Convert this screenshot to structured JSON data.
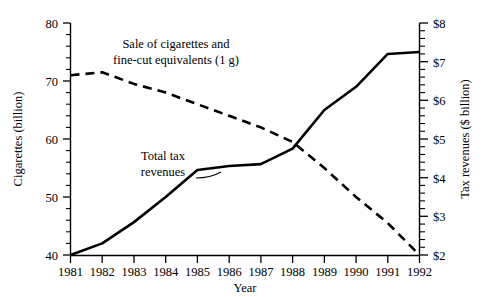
{
  "chart_data": {
    "type": "line",
    "title": "",
    "subtitle": "",
    "xlabel": "Year",
    "ylabel": "Cigarettes (billion)",
    "y2label": "Tax revenues ($ billion)",
    "x": [
      1981,
      1982,
      1983,
      1984,
      1985,
      1986,
      1987,
      1988,
      1989,
      1990,
      1991,
      1992
    ],
    "categories": [
      "1981",
      "1982",
      "1983",
      "1984",
      "1985",
      "1986",
      "1987",
      "1988",
      "1989",
      "1990",
      "1991",
      "1992"
    ],
    "xlim": [
      1981,
      1992
    ],
    "ylim": [
      40,
      80
    ],
    "y2lim": [
      2,
      8
    ],
    "y_ticks": [
      40,
      50,
      60,
      70,
      80
    ],
    "y_tick_labels": [
      "40",
      "50",
      "60",
      "70",
      "80"
    ],
    "y_minor_step": 2,
    "y2_ticks": [
      2,
      3,
      4,
      5,
      6,
      7,
      8
    ],
    "y2_tick_labels": [
      "$2",
      "$3",
      "$4",
      "$5",
      "$6",
      "$7",
      "$8"
    ],
    "y2_minor_step": 0.2,
    "grid": false,
    "legend_position": "inline-annotations",
    "series": [
      {
        "name": "Sale of cigarettes and fine-cut equivalents (1 g)",
        "axis": "left",
        "style": "dashed",
        "units": "billion cigarettes",
        "values": [
          71.0,
          71.5,
          69.5,
          68.0,
          66.0,
          64.0,
          62.0,
          59.5,
          55.0,
          50.0,
          45.5,
          40.0
        ]
      },
      {
        "name": "Total tax revenues",
        "axis": "right",
        "style": "solid",
        "units": "$ billion",
        "values": [
          2.0,
          2.3,
          2.85,
          3.5,
          4.2,
          4.3,
          4.35,
          4.75,
          5.75,
          6.35,
          7.2,
          7.25
        ]
      }
    ],
    "annotations": [
      {
        "name": "sale-of-cigarettes-label",
        "line1": "Sale of cigarettes and",
        "line2": "fine-cut equivalents (1 g)"
      },
      {
        "name": "total-tax-revenues-label",
        "line1": "Total tax",
        "line2": "revenues"
      }
    ],
    "colors": {
      "ink": "#000000",
      "background": "#ffffff"
    }
  },
  "axes": {
    "left": {
      "title": "Cigarettes (billion)",
      "labels": [
        "80",
        "70",
        "60",
        "50",
        "40"
      ]
    },
    "right": {
      "title": "Tax revenues ($ billion)",
      "labels": [
        "$8",
        "$7",
        "$6",
        "$5",
        "$4",
        "$3",
        "$2"
      ]
    },
    "bottom": {
      "title": "Year",
      "labels": [
        "1981",
        "1982",
        "1983",
        "1984",
        "1985",
        "1986",
        "1987",
        "1988",
        "1989",
        "1990",
        "1991",
        "1992"
      ]
    }
  },
  "annotations": {
    "cigarettes_line1": "Sale of cigarettes and",
    "cigarettes_line2": "fine-cut equivalents (1 g)",
    "tax_line1": "Total tax",
    "tax_line2": "revenues"
  }
}
